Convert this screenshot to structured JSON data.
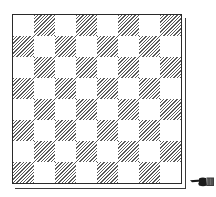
{
  "figure": {
    "type": "chessboard-diagram",
    "rows": 8,
    "columns": 8,
    "top_left_square": "light",
    "squares": [
      [
        "light",
        "dark",
        "light",
        "dark",
        "light",
        "dark",
        "light",
        "dark"
      ],
      [
        "dark",
        "light",
        "dark",
        "light",
        "dark",
        "light",
        "dark",
        "light"
      ],
      [
        "light",
        "dark",
        "light",
        "dark",
        "light",
        "dark",
        "light",
        "dark"
      ],
      [
        "dark",
        "light",
        "dark",
        "light",
        "dark",
        "light",
        "dark",
        "light"
      ],
      [
        "light",
        "dark",
        "light",
        "dark",
        "light",
        "dark",
        "light",
        "dark"
      ],
      [
        "dark",
        "light",
        "dark",
        "light",
        "dark",
        "light",
        "dark",
        "light"
      ],
      [
        "light",
        "dark",
        "light",
        "dark",
        "light",
        "dark",
        "light",
        "dark"
      ],
      [
        "dark",
        "light",
        "dark",
        "light",
        "dark",
        "light",
        "dark",
        "light"
      ]
    ],
    "dark_square_style": "diagonal-hatching",
    "pieces": [],
    "indicator": {
      "icon": "pointing-hand-icon",
      "direction": "left",
      "position": "bottom-right, beside last rank"
    },
    "colors": {
      "ink": "#2a2a2a",
      "paper": "#ffffff",
      "hatch": "#5a5a5a"
    }
  }
}
